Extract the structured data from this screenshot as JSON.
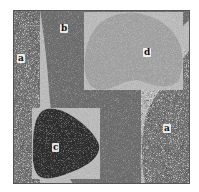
{
  "figure": {
    "type": "segmentation-phantom",
    "regions": [
      {
        "id": "a-left",
        "label": "a",
        "texture": "noisy",
        "base_color": "#7a7a7a"
      },
      {
        "id": "b",
        "label": "b",
        "texture": "smooth",
        "base_color": "#6e6e6e"
      },
      {
        "id": "c",
        "label": "c",
        "texture": "smooth",
        "base_color": "#2e2e2e"
      },
      {
        "id": "d",
        "label": "d",
        "texture": "smooth",
        "base_color": "#a3a3a3"
      },
      {
        "id": "a-right",
        "label": "a",
        "texture": "noisy",
        "base_color": "#7a7a7a"
      }
    ],
    "labels": {
      "a_left": "a",
      "b": "b",
      "c": "c",
      "d": "d",
      "a_right": "a"
    },
    "colors": {
      "background": "#ffffff",
      "border": "#555555",
      "region_a": "#7a7a7a",
      "region_b": "#6e6e6e",
      "region_c": "#2e2e2e",
      "region_d": "#a3a3a3"
    }
  }
}
